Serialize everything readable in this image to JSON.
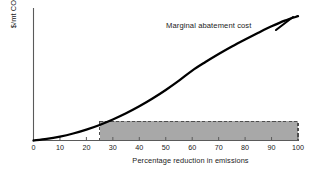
{
  "chart_data": {
    "type": "line",
    "title": "",
    "xlabel": "Percentage reduction in emissions",
    "ylabel": "$/mt CO2",
    "ylabel_text": "$/mt CO",
    "ylabel_sub": "2",
    "xlim": [
      0,
      100
    ],
    "ylim": [
      0,
      100
    ],
    "grid": false,
    "legend": "none",
    "xticks": [
      "0",
      "10",
      "20",
      "30",
      "40",
      "50",
      "60",
      "70",
      "80",
      "90",
      "100"
    ],
    "xtick_values": [
      0,
      10,
      20,
      30,
      40,
      50,
      60,
      70,
      80,
      90,
      100
    ],
    "yticks": [],
    "series": [
      {
        "name": "Marginal abatement cost",
        "annotation": "Marginal abatement cost",
        "color": "#000000",
        "x": [
          0,
          5,
          10,
          15,
          20,
          25,
          30,
          35,
          40,
          45,
          50,
          55,
          60,
          65,
          70,
          75,
          80,
          85,
          90,
          95,
          100
        ],
        "values": [
          0,
          1.2,
          3.0,
          5.4,
          8.4,
          12.0,
          16.2,
          21.0,
          26.4,
          32.4,
          39.0,
          46.2,
          54.0,
          60.6,
          66.8,
          72.6,
          78.0,
          83.2,
          88.2,
          92.6,
          96.0
        ]
      }
    ],
    "annotations": [
      {
        "name": "shaded-cost-region",
        "kind": "rectangle",
        "x0": 25,
        "x1": 100,
        "y0": 0,
        "y1": 15,
        "fill": "#a8a8a8",
        "border_style": "dashed",
        "border_color": "#4d4d4d"
      }
    ],
    "axis_color": "#5a5a5a",
    "background": "#ffffff"
  }
}
